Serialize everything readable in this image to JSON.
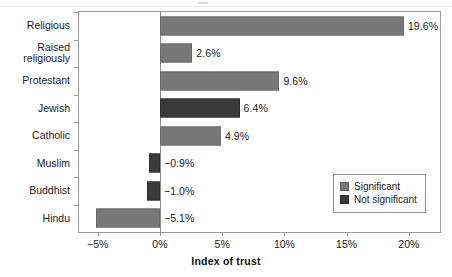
{
  "chart_data": {
    "type": "bar",
    "orientation": "horizontal",
    "title": "",
    "xlabel": "Index of trust",
    "ylabel": "",
    "xlim": [
      -6.5,
      22.5
    ],
    "xticks": [
      -5,
      0,
      5,
      10,
      15,
      20
    ],
    "xticklabels": [
      "−5%",
      "0%",
      "5%",
      "10%",
      "15%",
      "20%"
    ],
    "grid": false,
    "zero_reference_line": true,
    "categories": [
      "Religious",
      "Raised\nreligiously",
      "Protestant",
      "Jewish",
      "Catholic",
      "Muslim",
      "Buddhist",
      "Hindu"
    ],
    "values": [
      19.6,
      2.6,
      9.6,
      6.4,
      4.9,
      -0.9,
      -1.0,
      -5.1
    ],
    "value_labels": [
      "19.6%",
      "2.6%",
      "9.6%",
      "6.4%",
      "4.9%",
      "−0.9%",
      "−1.0%",
      "−5.1%"
    ],
    "significance": [
      "significant",
      "significant",
      "significant",
      "not_significant",
      "significant",
      "not_significant",
      "not_significant",
      "significant"
    ],
    "legend": {
      "position": "lower right",
      "entries": [
        {
          "label": "Significant",
          "key": "significant",
          "color": "#787878"
        },
        {
          "label": "Not significant",
          "key": "not_significant",
          "color": "#3a3a3a"
        }
      ]
    },
    "colors": {
      "significant": "#787878",
      "not_significant": "#3a3a3a",
      "axis": "#9a9a9a",
      "text": "#1a1a1a",
      "background": "#ffffff"
    }
  }
}
